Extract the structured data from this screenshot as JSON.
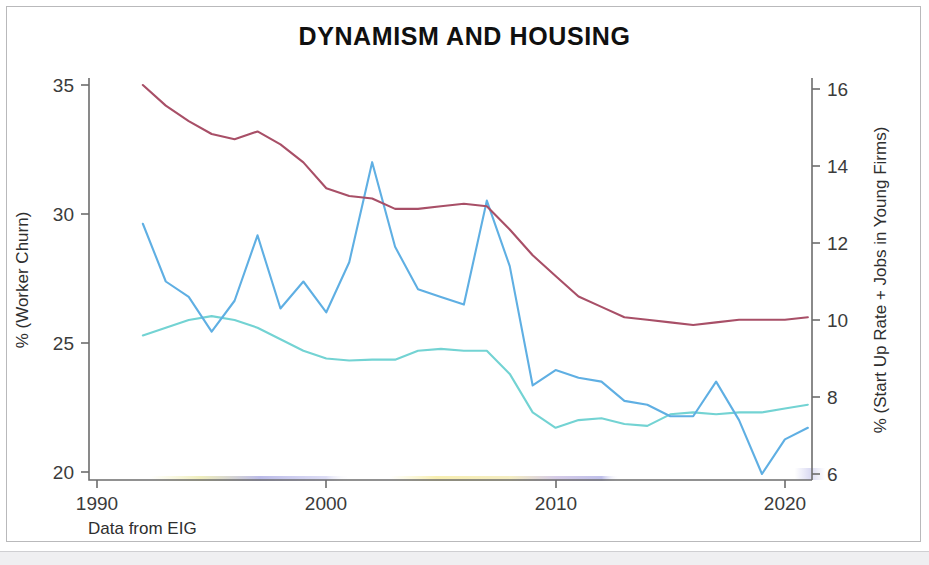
{
  "slide": {
    "title": "DYNAMISM AND HOUSING",
    "source_note": "Data from EIG"
  },
  "chart_data": {
    "type": "line",
    "title": "DYNAMISM AND HOUSING",
    "xlabel": "",
    "ylabel": "% (Worker Churn)",
    "y2label": "% (Start Up Rate + Jobs in Young Firms)",
    "xlim": [
      1990,
      2021.5
    ],
    "ylim": [
      20,
      35
    ],
    "y2lim": [
      6,
      16
    ],
    "grid": false,
    "legend": "none",
    "xticks": [
      1990,
      2000,
      2010,
      2020
    ],
    "xticklabels": [
      "1990",
      "2000",
      "2010",
      "2020"
    ],
    "yticks": [
      20,
      25,
      30,
      35
    ],
    "yticklabels": [
      "20",
      "25",
      "30",
      "35"
    ],
    "y2ticks": [
      6,
      8,
      10,
      12,
      14,
      16
    ],
    "y2ticklabels": [
      "6",
      "8",
      "10",
      "12",
      "14",
      "16"
    ],
    "x": [
      1992,
      1993,
      1994,
      1995,
      1996,
      1997,
      1998,
      1999,
      2000,
      2001,
      2002,
      2003,
      2004,
      2005,
      2006,
      2007,
      2008,
      2009,
      2010,
      2011,
      2012,
      2013,
      2014,
      2015,
      2016,
      2017,
      2018,
      2019,
      2020,
      2021
    ],
    "series": [
      {
        "name": "Worker Churn",
        "axis": "left",
        "color": "#a84f67",
        "values": [
          35.0,
          34.2,
          33.6,
          33.1,
          32.9,
          33.2,
          32.7,
          32.0,
          31.0,
          30.7,
          30.6,
          30.2,
          30.2,
          30.3,
          30.4,
          30.3,
          29.4,
          28.4,
          27.6,
          26.8,
          26.4,
          26.0,
          25.9,
          25.8,
          25.7,
          25.8,
          25.9,
          25.9,
          25.9,
          26.0
        ]
      },
      {
        "name": "Start Up Rate",
        "axis": "right",
        "color": "#5fafe3",
        "values": [
          12.5,
          11.0,
          10.6,
          9.7,
          10.5,
          12.2,
          10.3,
          11.0,
          10.2,
          11.5,
          14.1,
          11.9,
          10.8,
          10.6,
          10.4,
          13.1,
          11.4,
          8.3,
          8.7,
          8.5,
          8.4,
          7.9,
          7.8,
          7.5,
          7.5,
          8.4,
          7.4,
          6.0,
          6.9,
          7.2
        ]
      },
      {
        "name": "Jobs in Young Firms",
        "axis": "right",
        "color": "#73d3d3",
        "values": [
          9.6,
          9.8,
          10.0,
          10.1,
          10.0,
          9.8,
          9.5,
          9.2,
          9.0,
          8.95,
          8.97,
          8.97,
          9.2,
          9.25,
          9.2,
          9.2,
          8.6,
          7.6,
          7.2,
          7.4,
          7.45,
          7.3,
          7.25,
          7.55,
          7.6,
          7.55,
          7.6,
          7.6,
          7.7,
          7.8
        ]
      }
    ],
    "annotations": [
      {
        "name": "highlighter-smudge-yellow",
        "color": "#f2e06a"
      },
      {
        "name": "highlighter-smudge-blue",
        "color": "#6f6fd0"
      }
    ]
  },
  "geometry": {
    "plot_left": 89,
    "plot_right": 812,
    "plot_top": 78,
    "plot_bottom": 480,
    "x_1990": 97,
    "x_per_year": 22.93,
    "left_35_y": 85,
    "left_20_y": 472,
    "right_16_y": 89,
    "right_6_y": 474
  }
}
